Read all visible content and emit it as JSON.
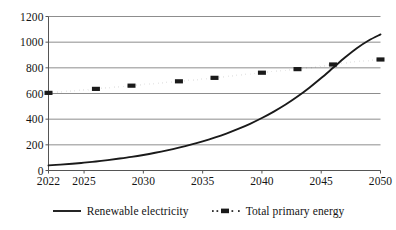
{
  "chart_data": {
    "type": "line",
    "title": "",
    "subtitle": "",
    "xlabel": "",
    "ylabel": "",
    "xlim": [
      2022,
      2050
    ],
    "ylim": [
      0,
      1200
    ],
    "grid": true,
    "grid_axis": "y",
    "legend_position": "bottom",
    "xticks": [
      "2022",
      "2025",
      "2030",
      "2035",
      "2040",
      "2045",
      "2050"
    ],
    "xtick_values": [
      2022,
      2025,
      2030,
      2035,
      2040,
      2045,
      2050
    ],
    "yticks": [
      "0",
      "200",
      "400",
      "600",
      "800",
      "1000",
      "1200"
    ],
    "ytick_values": [
      0,
      200,
      400,
      600,
      800,
      1000,
      1200
    ],
    "x": [
      2022,
      2023,
      2024,
      2025,
      2026,
      2027,
      2028,
      2029,
      2030,
      2031,
      2032,
      2033,
      2034,
      2035,
      2036,
      2037,
      2038,
      2039,
      2040,
      2041,
      2042,
      2043,
      2044,
      2045,
      2046,
      2047,
      2048,
      2049,
      2050
    ],
    "series": [
      {
        "name": "Renewable electricity",
        "style": "solid",
        "color": "#1a1a1a",
        "marker": "none",
        "values": [
          40,
          46,
          53,
          61,
          70,
          81,
          93,
          106,
          121,
          138,
          157,
          178,
          201,
          227,
          256,
          288,
          324,
          364,
          409,
          459,
          514,
          576,
          645,
          720,
          800,
          880,
          953,
          1013,
          1060
        ]
      },
      {
        "name": "Total primary energy",
        "style": "dotted",
        "color": "#1a1a1a",
        "marker": "square",
        "marker_x": [
          2022,
          2026,
          2029,
          2033,
          2036,
          2040,
          2043,
          2046,
          2050
        ],
        "values": [
          605,
          612,
          620,
          628,
          636,
          645,
          653,
          661,
          670,
          678,
          686,
          695,
          703,
          712,
          722,
          732,
          742,
          752,
          762,
          772,
          781,
          790,
          800,
          812,
          826,
          838,
          848,
          857,
          865
        ]
      }
    ]
  },
  "legend": {
    "entries": [
      {
        "label": "Renewable electricity",
        "swatch": "solid-line-swatch"
      },
      {
        "label": "Total primary energy",
        "swatch": "dotted-marker-swatch"
      }
    ]
  }
}
